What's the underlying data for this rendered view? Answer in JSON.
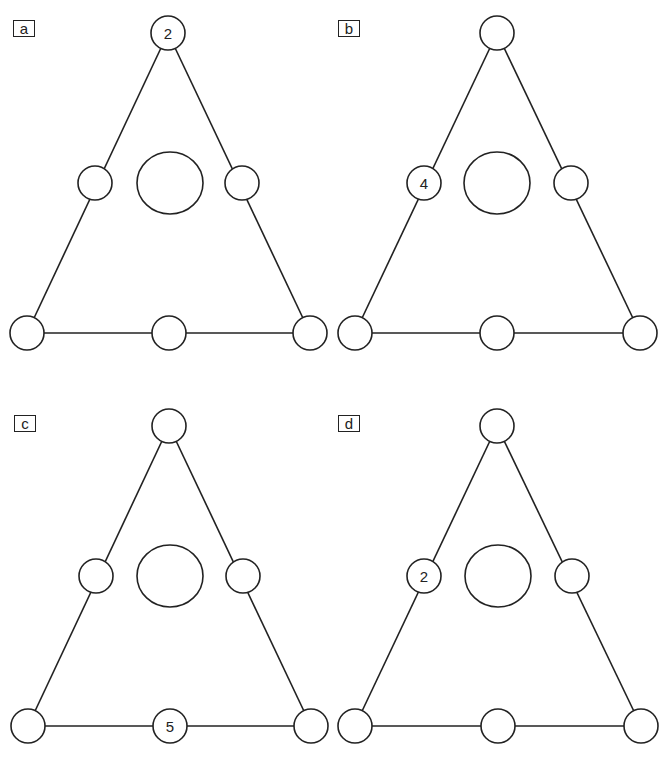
{
  "panels": [
    {
      "label": "a",
      "nodes": {
        "top": "2",
        "mid_left": "",
        "mid_right": "",
        "bottom_left": "",
        "bottom_mid": "",
        "bottom_right": "",
        "center": ""
      }
    },
    {
      "label": "b",
      "nodes": {
        "top": "",
        "mid_left": "4",
        "mid_right": "",
        "bottom_left": "",
        "bottom_mid": "",
        "bottom_right": "",
        "center": ""
      }
    },
    {
      "label": "c",
      "nodes": {
        "top": "",
        "mid_left": "",
        "mid_right": "",
        "bottom_left": "",
        "bottom_mid": "5",
        "bottom_right": "",
        "center": ""
      }
    },
    {
      "label": "d",
      "nodes": {
        "top": "",
        "mid_left": "2",
        "mid_right": "",
        "bottom_left": "",
        "bottom_mid": "",
        "bottom_right": "",
        "center": ""
      }
    }
  ],
  "colors": {
    "stroke": "#222222",
    "background": "#ffffff"
  }
}
